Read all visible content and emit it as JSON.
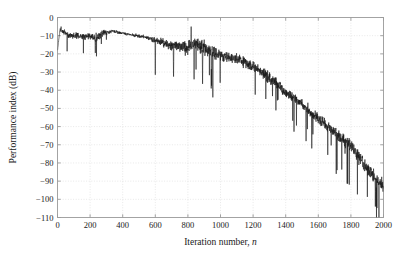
{
  "chart_data": {
    "type": "line",
    "title": "",
    "xlabel": "Iteration number, n",
    "xlabel_plain": "Iteration number,",
    "xlabel_italic": "n",
    "ylabel": "Performance index (dB)",
    "xlim": [
      0,
      2000
    ],
    "ylim": [
      -110,
      0
    ],
    "xticks": [
      0,
      200,
      400,
      600,
      800,
      1000,
      1200,
      1400,
      1600,
      1800,
      2000
    ],
    "xtick_labels": [
      "0",
      "200",
      "400",
      "600",
      "800",
      "1000",
      "1200",
      "1400",
      "1600",
      "1800",
      "2000"
    ],
    "yticks": [
      0,
      -10,
      -20,
      -30,
      -40,
      -50,
      -60,
      -70,
      -80,
      -90,
      -100,
      -110
    ],
    "ytick_labels": [
      "0",
      "−10",
      "−20",
      "−30",
      "−40",
      "−50",
      "−60",
      "−70",
      "−80",
      "−90",
      "−100",
      "−110"
    ],
    "grid": true,
    "grid_style": "dotted",
    "grid_color": "#d8d8d8",
    "line_color": "#1a1a1a",
    "line_width": 0.6,
    "legend": null,
    "series": [
      {
        "name": "Performance index",
        "description": "Adaptive filter learning curve: noisy trace starting near -18 dB, rising to a -6 to -12 dB plateau through n=600, then decaying roughly linearly from -15 dB at n=700 to -95 dB at n=2000 with increasing spike variance.",
        "envelope_x": [
          0,
          20,
          60,
          120,
          200,
          240,
          280,
          340,
          420,
          520,
          600,
          700,
          800,
          860,
          900,
          1000,
          1100,
          1200,
          1300,
          1400,
          1500,
          1600,
          1700,
          1800,
          1900,
          2000
        ],
        "envelope_mean": [
          -18,
          -6.5,
          -9.5,
          -10.5,
          -10.0,
          -11.5,
          -8.5,
          -7.5,
          -9.0,
          -10.5,
          -12.5,
          -15.5,
          -16.5,
          -14.5,
          -17.0,
          -20.5,
          -22.5,
          -27.0,
          -33.0,
          -41.0,
          -48.0,
          -56.0,
          -63.0,
          -71.0,
          -83.0,
          -93.0
        ],
        "envelope_spread": [
          3.0,
          2.5,
          3.0,
          3.5,
          3.5,
          5.0,
          3.0,
          1.5,
          1.5,
          2.0,
          3.0,
          5.5,
          7.0,
          8.5,
          8.0,
          6.5,
          6.0,
          5.5,
          5.5,
          5.5,
          5.5,
          6.0,
          6.5,
          7.0,
          7.5,
          8.0
        ],
        "notable_points": [
          {
            "x": 0,
            "y": -18.0,
            "note": "start"
          },
          {
            "x": 22,
            "y": -5.0,
            "note": "initial rise peak"
          },
          {
            "x": 232,
            "y": -19.5,
            "note": "early downward spike"
          },
          {
            "x": 330,
            "y": -7.0,
            "note": "plateau maximum"
          },
          {
            "x": 600,
            "y": -31.5,
            "note": "deep notch"
          },
          {
            "x": 712,
            "y": -32.5,
            "note": "deep notch"
          },
          {
            "x": 820,
            "y": -5.0,
            "note": "large upward spike"
          },
          {
            "x": 838,
            "y": -34.0,
            "note": "deep notch"
          },
          {
            "x": 890,
            "y": -36.5,
            "note": "deep notch"
          },
          {
            "x": 945,
            "y": -37.5,
            "note": "deep notch"
          },
          {
            "x": 1360,
            "y": -39.0,
            "note": "local peak"
          },
          {
            "x": 1525,
            "y": -68.0,
            "note": "deep notch"
          },
          {
            "x": 1560,
            "y": -72.0,
            "note": "deep notch"
          },
          {
            "x": 1710,
            "y": -86.0,
            "note": "deep notch"
          },
          {
            "x": 1950,
            "y": -104.0,
            "note": "deepest tail notch"
          },
          {
            "x": 2000,
            "y": -94.0,
            "note": "end"
          }
        ]
      }
    ]
  },
  "figure": {
    "background_color": "#ffffff",
    "axes_color": "#9a9a9a"
  }
}
